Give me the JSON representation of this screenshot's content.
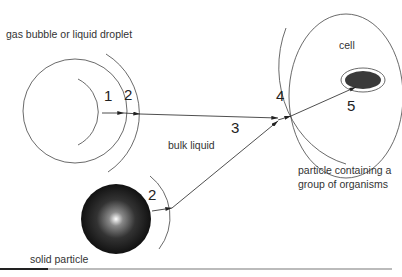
{
  "labels": {
    "gas_bubble": "gas bubble or liquid droplet",
    "bulk_liquid": "bulk liquid",
    "solid_particle": "solid particle",
    "cell": "cell",
    "particle_group_line1": "particle containing a",
    "particle_group_line2": "group of organisms"
  },
  "steps": {
    "s1": "1",
    "s2_bubble": "2",
    "s2_solid": "2",
    "s3": "3",
    "s4": "4",
    "s5": "5"
  },
  "colors": {
    "line": "#333333",
    "organism_fill": "#3a3a3a",
    "particle_center": "#ffffff",
    "particle_edge": "#111111"
  }
}
